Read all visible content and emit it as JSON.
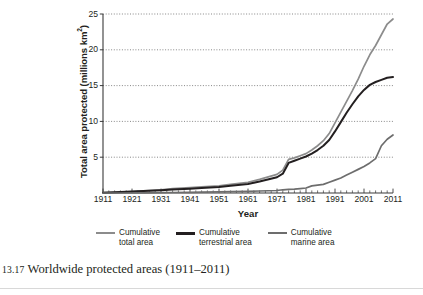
{
  "figure": {
    "caption_number": "13.17",
    "caption_text": "Worldwide protected areas (1911–2011)"
  },
  "chart_data": {
    "type": "line",
    "title": "",
    "xlabel": "Year",
    "ylabel": "Total area protected (millions km²)",
    "ylabel_base": "Total area protected (millions km",
    "ylabel_exponent": "2",
    "ylabel_close": ")",
    "xlim": [
      1911,
      2011
    ],
    "ylim": [
      0,
      25
    ],
    "yticks": [
      5,
      10,
      15,
      20,
      25
    ],
    "ytick_labels": [
      "5",
      "10",
      "15",
      "20",
      "25"
    ],
    "xticks": [
      1911,
      1921,
      1931,
      1941,
      1951,
      1961,
      1971,
      1981,
      1991,
      2001,
      2011
    ],
    "xtick_labels": [
      "1911",
      "1921",
      "1931",
      "1941",
      "1951",
      "1961",
      "1971",
      "1981",
      "1991",
      "2001",
      "2011"
    ],
    "xminor_step": 2,
    "grid": "horizontal-dotted",
    "legend_position": "below-axis",
    "colors": {
      "total": "#8c8c8c",
      "terrestrial": "#231f20",
      "marine": "#6d6d6d",
      "grid": "#555555",
      "axis": "#3a3a3a"
    },
    "x": [
      1911,
      1915,
      1921,
      1925,
      1931,
      1935,
      1941,
      1945,
      1951,
      1955,
      1961,
      1965,
      1971,
      1973,
      1975,
      1977,
      1979,
      1981,
      1983,
      1985,
      1987,
      1989,
      1991,
      1993,
      1995,
      1997,
      1999,
      2001,
      2003,
      2005,
      2007,
      2009,
      2011
    ],
    "series": [
      {
        "name": "Cumulative total area",
        "label": "Cumulative\ntotal area",
        "color": "#8c8c8c",
        "width": 1.7,
        "values": [
          0.05,
          0.1,
          0.2,
          0.3,
          0.45,
          0.6,
          0.75,
          0.85,
          1.0,
          1.2,
          1.5,
          1.9,
          2.6,
          3.2,
          4.7,
          4.9,
          5.2,
          5.5,
          6.0,
          6.6,
          7.3,
          8.3,
          9.8,
          11.3,
          12.8,
          14.3,
          15.9,
          17.7,
          19.3,
          20.6,
          22.1,
          23.6,
          24.3
        ]
      },
      {
        "name": "Cumulative terrestrial area",
        "label": "Cumulative\nterrestrial area",
        "color": "#231f20",
        "width": 2.0,
        "values": [
          0.05,
          0.1,
          0.2,
          0.28,
          0.4,
          0.5,
          0.6,
          0.7,
          0.85,
          1.0,
          1.25,
          1.6,
          2.2,
          2.7,
          4.2,
          4.5,
          4.8,
          5.1,
          5.5,
          6.0,
          6.6,
          7.4,
          8.6,
          9.9,
          11.2,
          12.4,
          13.5,
          14.4,
          15.1,
          15.5,
          15.8,
          16.1,
          16.2
        ]
      },
      {
        "name": "Cumulative marine area",
        "label": "Cumulative\nmarine area",
        "color": "#6d6d6d",
        "width": 1.7,
        "values": [
          0.0,
          0.0,
          0.0,
          0.02,
          0.05,
          0.07,
          0.1,
          0.12,
          0.15,
          0.18,
          0.22,
          0.28,
          0.35,
          0.45,
          0.5,
          0.55,
          0.62,
          0.7,
          1.0,
          1.1,
          1.2,
          1.5,
          1.8,
          2.1,
          2.5,
          2.9,
          3.3,
          3.7,
          4.2,
          4.8,
          6.6,
          7.5,
          8.1
        ]
      }
    ]
  },
  "legend": {
    "items": [
      {
        "label_line1": "Cumulative",
        "label_line2": "total area",
        "color": "#8c8c8c"
      },
      {
        "label_line1": "Cumulative",
        "label_line2": "terrestrial area",
        "color": "#231f20"
      },
      {
        "label_line1": "Cumulative",
        "label_line2": "marine area",
        "color": "#6d6d6d"
      }
    ]
  }
}
